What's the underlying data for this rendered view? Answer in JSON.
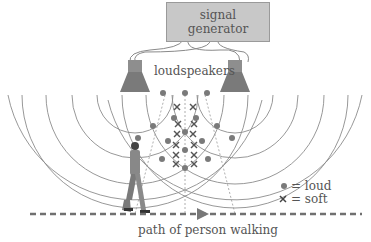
{
  "diagram": {
    "signal_generator": {
      "line1": "signal",
      "line2": "generator"
    },
    "loudspeakers_label": "loudspeakers",
    "path_label": "path of person walking",
    "legend": {
      "loud": {
        "symbol": "●",
        "label": "= loud"
      },
      "soft": {
        "symbol": "×",
        "label": "= soft"
      }
    }
  },
  "colors": {
    "stroke": "#888888",
    "dot": "#7a7a7a",
    "box": "#c8c8c8",
    "text": "#555555"
  }
}
